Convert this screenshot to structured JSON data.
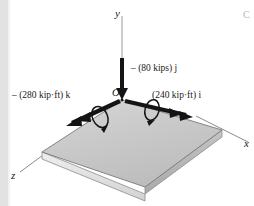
{
  "figure": {
    "type": "engineering-mechanics-free-body-diagram",
    "background_color": "#ffffff",
    "ink_color": "#1a1a1a"
  },
  "axes": {
    "y_label": "y",
    "x_label": "x",
    "z_label": "z",
    "origin_label": "O"
  },
  "vectors": [
    {
      "id": "force-y",
      "label": "– (80 kips) j",
      "magnitude": 80,
      "unit": "kips",
      "direction": "-j",
      "kind": "force"
    },
    {
      "id": "couple-z",
      "label": "– (280 kip·ft) k",
      "magnitude": 280,
      "unit": "kip·ft",
      "direction": "-k",
      "kind": "couple"
    },
    {
      "id": "couple-x",
      "label": "(240 kip·ft) i",
      "magnitude": 240,
      "unit": "kip·ft",
      "direction": "+i",
      "kind": "couple"
    }
  ],
  "page_artifact": {
    "corner_glyph": "C"
  },
  "plate": {
    "description": "shaded rectangular plate in isometric view",
    "top_face_color": "#c9c9c9",
    "front_edge_color": "#e8e8e8",
    "side_edge_color": "#b4b4b4",
    "outline_color": "#7a7a7a"
  },
  "colors": {
    "strip": "#e2e2e2",
    "arrow": "#1a1a1a",
    "axis_line": "#8a8a8a"
  }
}
